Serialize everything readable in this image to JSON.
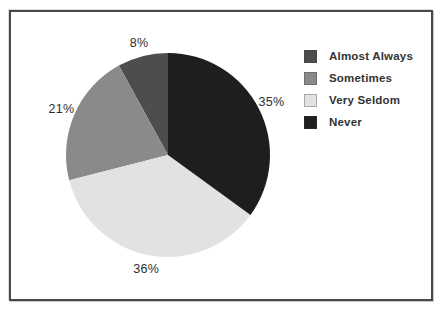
{
  "chart_data": {
    "type": "pie",
    "title": "",
    "legend_position": "right",
    "direction_drawn": "counterclockwise-from-top",
    "order_clockwise_from_top": [
      "Never",
      "Very Seldom",
      "Sometimes",
      "Almost Always"
    ],
    "segments": [
      {
        "label": "Almost Always",
        "value": 8,
        "pct_label": "8%",
        "color": "#4d4d4d"
      },
      {
        "label": "Sometimes",
        "value": 21,
        "pct_label": "21%",
        "color": "#8a8a8a"
      },
      {
        "label": "Very Seldom",
        "value": 36,
        "pct_label": "36%",
        "color": "#e2e2e2"
      },
      {
        "label": "Never",
        "value": 35,
        "pct_label": "35%",
        "color": "#1e1e1e"
      }
    ],
    "geometry": {
      "cx": 168,
      "cy": 155,
      "radius": 102,
      "label_radius": 116
    }
  }
}
